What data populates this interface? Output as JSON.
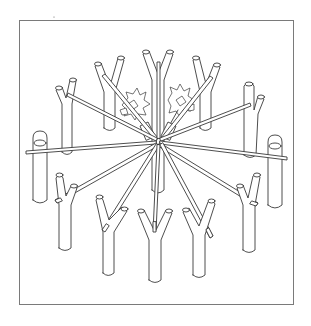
{
  "figure": {
    "frame_color": "#7a7a7a",
    "line_color": "#3a3a3a",
    "background": "#ffffff",
    "hub": {
      "x": 158,
      "y": 142
    },
    "stakes": [
      {
        "id": "top-center",
        "x": 158,
        "y": 60,
        "type": "fork"
      },
      {
        "id": "top-left",
        "x": 110,
        "y": 68,
        "type": "fork"
      },
      {
        "id": "top-right",
        "x": 205,
        "y": 68,
        "type": "fork"
      },
      {
        "id": "upper-left",
        "x": 68,
        "y": 95,
        "type": "fork"
      },
      {
        "id": "upper-right",
        "x": 250,
        "y": 95,
        "type": "fork"
      },
      {
        "id": "left",
        "x": 40,
        "y": 150,
        "type": "post"
      },
      {
        "id": "right",
        "x": 275,
        "y": 150,
        "type": "post"
      },
      {
        "id": "lower-left",
        "x": 65,
        "y": 195,
        "type": "fork"
      },
      {
        "id": "lower-right",
        "x": 248,
        "y": 195,
        "type": "fork"
      },
      {
        "id": "bottom-left",
        "x": 110,
        "y": 220,
        "type": "fork"
      },
      {
        "id": "bottom-center",
        "x": 155,
        "y": 228,
        "type": "fork"
      },
      {
        "id": "bottom-right",
        "x": 198,
        "y": 220,
        "type": "fork"
      }
    ],
    "pole_count": 12
  }
}
